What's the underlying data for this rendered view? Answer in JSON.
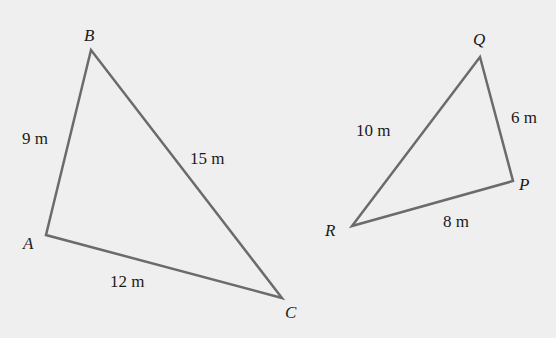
{
  "background": "#efefef",
  "stroke_color": "#6b6b6b",
  "triangles": [
    {
      "name": "ABC",
      "vertices": {
        "A": {
          "label": "A",
          "x": 46,
          "y": 235
        },
        "B": {
          "label": "B",
          "x": 91,
          "y": 50
        },
        "C": {
          "label": "C",
          "x": 282,
          "y": 298
        }
      },
      "sides": {
        "AB": "9 m",
        "BC": "15 m",
        "AC": "12 m"
      }
    },
    {
      "name": "PQR",
      "vertices": {
        "P": {
          "label": "P",
          "x": 513,
          "y": 181
        },
        "Q": {
          "label": "Q",
          "x": 480,
          "y": 57
        },
        "R": {
          "label": "R",
          "x": 352,
          "y": 226
        }
      },
      "sides": {
        "QP": "6 m",
        "QR": "10 m",
        "RP": "8 m"
      }
    }
  ]
}
